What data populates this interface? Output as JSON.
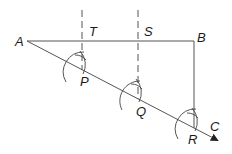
{
  "diagram": {
    "type": "geometric-construction",
    "colors": {
      "stroke": "#555555",
      "text": "#1a1a1a",
      "background": "#ffffff"
    },
    "labels": {
      "A": "A",
      "B": "B",
      "C": "C",
      "P": "P",
      "Q": "Q",
      "R": "R",
      "S": "S",
      "T": "T"
    },
    "points": {
      "A": [
        27,
        41
      ],
      "B": [
        194,
        41
      ],
      "T": [
        82,
        41
      ],
      "S": [
        138,
        41
      ],
      "P": [
        82,
        70
      ],
      "Q": [
        138,
        99
      ],
      "R": [
        194,
        128
      ],
      "C": [
        218,
        141
      ]
    },
    "segments": [
      {
        "name": "AB",
        "style": "solid"
      },
      {
        "name": "AC",
        "style": "solid-arrow"
      },
      {
        "name": "BR",
        "style": "solid"
      },
      {
        "name": "TP",
        "style": "dashed-extended"
      },
      {
        "name": "SQ",
        "style": "dashed-extended"
      }
    ]
  }
}
